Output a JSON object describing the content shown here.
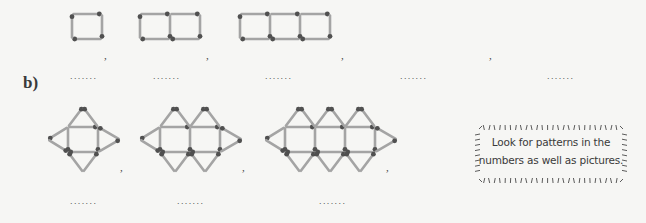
{
  "part_b": {
    "label": "b)",
    "pattern": "squares-with-triangles",
    "figures": [
      {
        "squares": 1
      },
      {
        "squares": 2
      },
      {
        "squares": 3
      }
    ],
    "separators": [
      ",",
      ",",
      ","
    ],
    "answer_blanks": [
      ".......",
      ".......",
      "......."
    ]
  },
  "part_a": {
    "pattern": "row-of-squares",
    "figures": [
      {
        "squares": 1
      },
      {
        "squares": 2
      },
      {
        "squares": 3
      }
    ],
    "separators": [
      ",",
      ",",
      ",",
      ","
    ],
    "answer_blanks": [
      ".......",
      ".......",
      ".......",
      ".......",
      "......."
    ]
  },
  "tip": {
    "line1": "Look for patterns in the",
    "line2": "numbers as well as pictures."
  },
  "colors": {
    "matchstick": "#a4a4a4",
    "match_head": "#505050",
    "bubble_ticks": "#4a4a4a"
  }
}
